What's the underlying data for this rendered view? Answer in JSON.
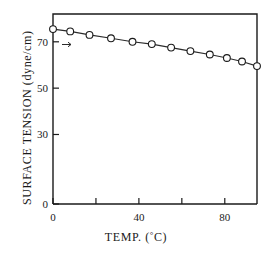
{
  "chart_data": {
    "type": "line",
    "title": "",
    "xlabel": "TEMP. (°C)",
    "ylabel": "SURFACE TENSION (dyne/cm)",
    "xlim": [
      0,
      95
    ],
    "ylim": [
      0,
      82
    ],
    "grid": false,
    "legend": null,
    "marker": "open-circle",
    "x_ticks": [
      {
        "value": 0,
        "label": "0",
        "major": true
      },
      {
        "value": 20,
        "label": "",
        "major": false
      },
      {
        "value": 40,
        "label": "40",
        "major": true
      },
      {
        "value": 60,
        "label": "",
        "major": false
      },
      {
        "value": 80,
        "label": "80",
        "major": true
      }
    ],
    "y_ticks": [
      {
        "value": 0,
        "label": "0"
      },
      {
        "value": 30,
        "label": "30"
      },
      {
        "value": 50,
        "label": "50"
      },
      {
        "value": 70,
        "label": "70"
      }
    ],
    "series": [
      {
        "name": "surface tension of water",
        "x": [
          0,
          8,
          17,
          27,
          37,
          46,
          55,
          64,
          73,
          81,
          88,
          95
        ],
        "values": [
          75.5,
          74.5,
          73.0,
          71.5,
          70.0,
          69.0,
          67.5,
          66.0,
          64.5,
          63.0,
          61.5,
          59.5
        ]
      }
    ]
  },
  "figure": {
    "x_axis_caption": "TEMP. (",
    "x_axis_caption_degree": "°",
    "x_axis_caption_tail": "C)",
    "y_axis_caption": "SURFACE TENSION (dyne/cm)"
  },
  "colors": {
    "axis": "#1a1a1a",
    "line": "#2b2b2b",
    "marker_fill": "#ffffff",
    "marker_stroke": "#1a1a1a",
    "background": "#ffffff"
  }
}
